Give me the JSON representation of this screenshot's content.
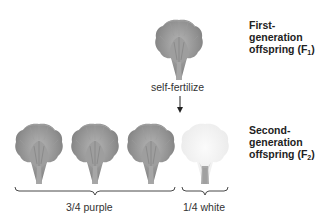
{
  "f1": {
    "label_line1": "First-",
    "label_line2": "generation",
    "label_line3": "offspring (F",
    "label_sub": "1",
    "label_close": ")",
    "flower_color": "purple",
    "count": 1
  },
  "cross": {
    "label": "self-fertilize",
    "arrow": "down-arrow-icon"
  },
  "f2": {
    "label_line1": "Second-",
    "label_line2": "generation",
    "label_line3": "offspring (F",
    "label_sub": "2",
    "label_close": ")",
    "flowers": [
      {
        "color": "purple"
      },
      {
        "color": "purple"
      },
      {
        "color": "purple"
      },
      {
        "color": "white"
      }
    ],
    "groups": [
      {
        "label": "3/4 purple",
        "count": 3
      },
      {
        "label": "1/4 white",
        "count": 1
      }
    ]
  },
  "colors": {
    "purple_flower": "#8c8c8c",
    "white_flower": "#f2f2f2",
    "stem": "#9a9a9a",
    "text": "#222222"
  }
}
